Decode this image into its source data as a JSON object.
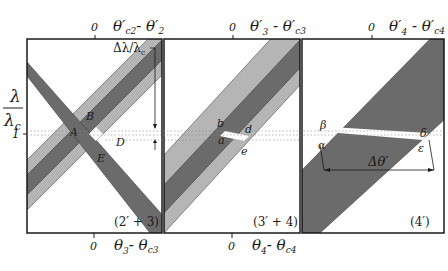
{
  "colors": {
    "background": "#ffffff",
    "frame": "#1a1a1a",
    "light_band": "#b5b5b5",
    "dark_band": "#6b6b6b",
    "overlap_white": "#ffffff",
    "dotted_line": "#8a8a8a"
  },
  "y_axis": {
    "label_top": "λ",
    "label_bottom": "λc",
    "tick_label": "1"
  },
  "panels": [
    {
      "id": "panel-2prime-3",
      "caption": "(2′ + 3)",
      "top_axis": {
        "zero": "0",
        "label": "θ′c2 - θ′2"
      },
      "bottom_axis": {
        "zero": "0",
        "label": "θ3 - θc3"
      },
      "annotation": "Δλ/λc",
      "points": [
        "A",
        "B",
        "D",
        "E"
      ]
    },
    {
      "id": "panel-3prime-4",
      "caption": "(3′ + 4)",
      "top_axis": {
        "zero": "0",
        "label": "θ′3 - θ′c3"
      },
      "bottom_axis": {
        "zero": "0",
        "label": "θ4 - θc4"
      },
      "points": [
        "a",
        "b",
        "d",
        "e"
      ]
    },
    {
      "id": "panel-4prime",
      "caption": "(4′)",
      "top_axis": {
        "zero": "0",
        "label": "θ′4 - θ′c4"
      },
      "annotation": "Δθ′",
      "points": [
        "α",
        "β",
        "δ",
        "ε"
      ]
    }
  ]
}
